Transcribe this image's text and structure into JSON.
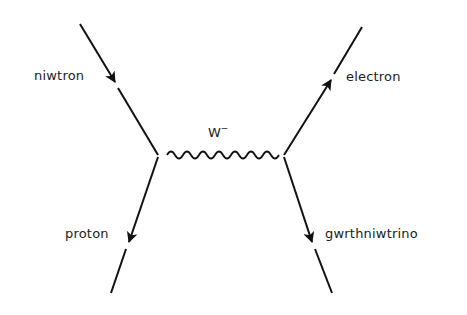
{
  "colors": {
    "line": "#111111",
    "text": "#222222",
    "background": "#ffffff"
  },
  "particles": {
    "neutron": {
      "label": "niwtron"
    },
    "proton": {
      "label": "proton"
    },
    "electron": {
      "label": "electron"
    },
    "antineutrino": {
      "label": "gwrthniwtrino"
    }
  },
  "boson": {
    "label": "W",
    "charge": "−"
  }
}
